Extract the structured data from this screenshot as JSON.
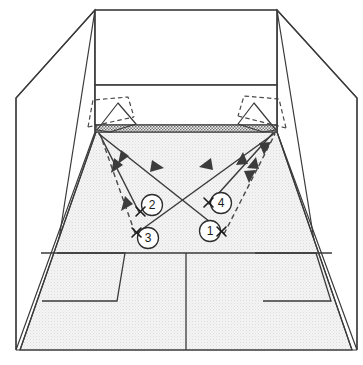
{
  "diagram": {
    "type": "squash-court-perspective",
    "colors": {
      "line": "#3a3a3a",
      "floor": "#f1f1f1",
      "tin": "#d8d8d8",
      "ink": "#1c1c1c",
      "background": "#ffffff"
    },
    "court": {
      "front_wall_label": "front-wall",
      "tin_label": "tin",
      "short_line_label": "short-line",
      "half_court_line_label": "half-court-line",
      "service_box_left_label": "left-service-box",
      "service_box_right_label": "right-service-box",
      "side_wall_left_label": "left-side-wall",
      "side_wall_right_label": "right-side-wall"
    },
    "positions": [
      {
        "id": "1",
        "label": "1",
        "cx": 210,
        "cy": 231,
        "mark_x": 222,
        "mark_y": 232
      },
      {
        "id": "2",
        "label": "2",
        "cx": 152,
        "cy": 205,
        "mark_x": 141,
        "mark_y": 211
      },
      {
        "id": "3",
        "label": "3",
        "cx": 148,
        "cy": 238,
        "mark_x": 137,
        "mark_y": 232
      },
      {
        "id": "4",
        "label": "4",
        "cx": 221,
        "cy": 203,
        "mark_x": 209,
        "mark_y": 202
      }
    ],
    "shots": [
      {
        "name": "straight-drive-left-solid",
        "style": "solid"
      },
      {
        "name": "straight-drive-left-dashed",
        "style": "dashed"
      },
      {
        "name": "cross-court-left-to-right-solid",
        "style": "solid"
      },
      {
        "name": "cross-court-right-to-left-solid",
        "style": "solid"
      },
      {
        "name": "straight-drive-right-solid",
        "style": "solid"
      },
      {
        "name": "straight-drive-right-dashed",
        "style": "dashed"
      }
    ],
    "rackets": [
      {
        "name": "racket-left-solid",
        "style": "solid"
      },
      {
        "name": "racket-left-dashed",
        "style": "dashed"
      },
      {
        "name": "racket-right-solid",
        "style": "solid"
      },
      {
        "name": "racket-right-dashed",
        "style": "dashed"
      }
    ]
  }
}
